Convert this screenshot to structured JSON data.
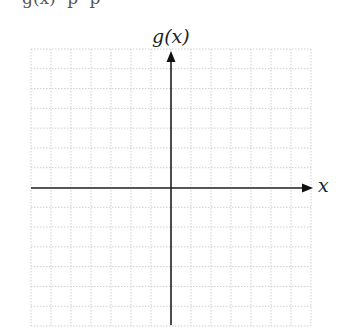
{
  "top_text": "g(x)   p   p",
  "graph": {
    "y_axis_label": "g(x)",
    "x_axis_label": "x",
    "grid": {
      "columns": 14,
      "rows": 14,
      "cell_px": 20,
      "line_style": "dotted",
      "line_color": "#cfcfcf"
    },
    "axis_color": "#222222",
    "origin": {
      "col": 7,
      "row": 7
    },
    "x_axis_arrow": "right",
    "y_axis_arrow": "up"
  }
}
